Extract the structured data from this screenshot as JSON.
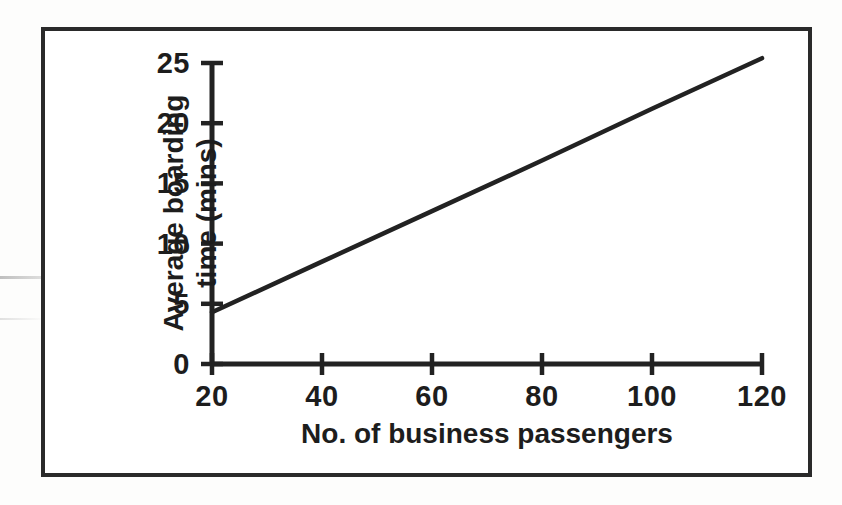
{
  "figure": {
    "background_color": "#ffffff",
    "frame_color": "#2a2a2a",
    "line_color": "#222222"
  },
  "chart_data": {
    "type": "line",
    "title": "",
    "subtitle": "",
    "xlabel": "No. of business passengers",
    "ylabel": "Average boarding time (mins)",
    "ylabel_line1": "Average boarding",
    "ylabel_line2": "time (mins)",
    "xlim": [
      20,
      120
    ],
    "ylim": [
      0,
      25
    ],
    "xticks": [
      20,
      40,
      60,
      80,
      100,
      120
    ],
    "yticks": [
      0,
      5,
      10,
      15,
      20,
      25
    ],
    "xtick_labels": [
      "20",
      "40",
      "60",
      "80",
      "100",
      "120"
    ],
    "ytick_labels": [
      "0",
      "5",
      "10",
      "15",
      "20",
      "25"
    ],
    "grid": false,
    "legend": false,
    "legend_position": "none",
    "series": [
      {
        "name": "Average boarding time",
        "x": [
          20,
          40,
          60,
          80,
          100,
          120
        ],
        "values": [
          4.3,
          8.5,
          12.7,
          16.9,
          21.2,
          25.4
        ]
      }
    ],
    "annotations": []
  }
}
